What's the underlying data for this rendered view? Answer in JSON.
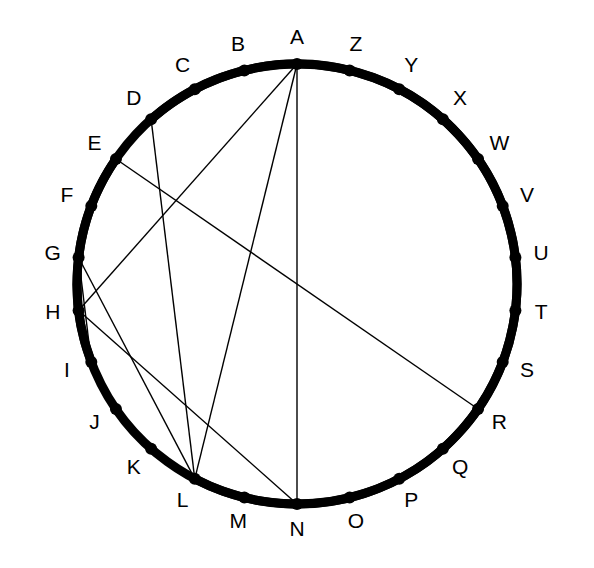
{
  "figure": {
    "title": "",
    "type": "circle-chord-diagram",
    "background_color": "#ffffff",
    "stroke_color": "#000000",
    "circle": {
      "center_x": 297,
      "center_y": 284,
      "radius": 220,
      "stroke_width": 1.4
    },
    "vertex_dot": {
      "radius": 6,
      "fill": "#000000"
    },
    "label_offset": 26,
    "label_font_size": 21
  },
  "vertices": [
    {
      "id": "A",
      "label": "A",
      "angle_deg": 90,
      "label_angle_deg": 90
    },
    {
      "id": "B",
      "label": "B",
      "angle_deg": 103.846153846154,
      "label_angle_deg": 103.846153846154
    },
    {
      "id": "C",
      "label": "C",
      "angle_deg": 117.692307692308,
      "label_angle_deg": 117.692307692308
    },
    {
      "id": "D",
      "label": "D",
      "angle_deg": 131.538461538462,
      "label_angle_deg": 131.538461538462
    },
    {
      "id": "E",
      "label": "E",
      "angle_deg": 145.384615384615,
      "label_angle_deg": 145.384615384615
    },
    {
      "id": "F",
      "label": "F",
      "angle_deg": 159.230769230769,
      "label_angle_deg": 159.230769230769
    },
    {
      "id": "G",
      "label": "G",
      "angle_deg": 173.076923076923,
      "label_angle_deg": 173.076923076923
    },
    {
      "id": "H",
      "label": "H",
      "angle_deg": 186.923076923077,
      "label_angle_deg": 186.923076923077
    },
    {
      "id": "I",
      "label": "I",
      "angle_deg": 200.769230769231,
      "label_angle_deg": 200.769230769231
    },
    {
      "id": "J",
      "label": "J",
      "angle_deg": 214.615384615385,
      "label_angle_deg": 214.615384615385
    },
    {
      "id": "K",
      "label": "K",
      "angle_deg": 228.461538461538,
      "label_angle_deg": 228.461538461538
    },
    {
      "id": "L",
      "label": "L",
      "angle_deg": 242.307692307692,
      "label_angle_deg": 242.307692307692
    },
    {
      "id": "M",
      "label": "M",
      "angle_deg": 256.153846153846,
      "label_angle_deg": 256.153846153846
    },
    {
      "id": "N",
      "label": "N",
      "angle_deg": 270,
      "label_angle_deg": 270
    },
    {
      "id": "O",
      "label": "O",
      "angle_deg": 283.846153846154,
      "label_angle_deg": 283.846153846154
    },
    {
      "id": "P",
      "label": "P",
      "angle_deg": 297.692307692308,
      "label_angle_deg": 297.692307692308
    },
    {
      "id": "Q",
      "label": "Q",
      "angle_deg": 311.538461538462,
      "label_angle_deg": 311.538461538462
    },
    {
      "id": "R",
      "label": "R",
      "angle_deg": 325.384615384615,
      "label_angle_deg": 325.384615384615
    },
    {
      "id": "S",
      "label": "S",
      "angle_deg": 339.230769230769,
      "label_angle_deg": 339.230769230769
    },
    {
      "id": "T",
      "label": "T",
      "angle_deg": 353.076923076923,
      "label_angle_deg": 353.076923076923
    },
    {
      "id": "U",
      "label": "U",
      "angle_deg": 6.92307692307692,
      "label_angle_deg": 6.92307692307692
    },
    {
      "id": "V",
      "label": "V",
      "angle_deg": 20.7692307692308,
      "label_angle_deg": 20.7692307692308
    },
    {
      "id": "W",
      "label": "W",
      "angle_deg": 34.6153846153846,
      "label_angle_deg": 34.6153846153846
    },
    {
      "id": "X",
      "label": "X",
      "angle_deg": 48.4615384615385,
      "label_angle_deg": 48.4615384615385
    },
    {
      "id": "Y",
      "label": "Y",
      "angle_deg": 62.3076923076923,
      "label_angle_deg": 62.3076923076923
    },
    {
      "id": "Z",
      "label": "Z",
      "angle_deg": 76.1538461538462,
      "label_angle_deg": 76.1538461538462
    }
  ],
  "chords": [
    {
      "from": "A",
      "to": "N",
      "width": 1.4
    },
    {
      "from": "A",
      "to": "L",
      "width": 1.4
    },
    {
      "from": "A",
      "to": "H",
      "width": 1.4
    },
    {
      "from": "E",
      "to": "R",
      "width": 1.4
    },
    {
      "from": "D",
      "to": "L",
      "width": 1.4
    },
    {
      "from": "G",
      "to": "I",
      "width": 1.4
    },
    {
      "from": "G",
      "to": "L",
      "width": 1.4
    },
    {
      "from": "H",
      "to": "N",
      "width": 1.4
    }
  ],
  "thick_arcs": [
    {
      "from": "D",
      "to": "E",
      "width": 9
    },
    {
      "from": "I",
      "to": "L",
      "width": 9
    }
  ],
  "legend": {
    "note": ""
  }
}
